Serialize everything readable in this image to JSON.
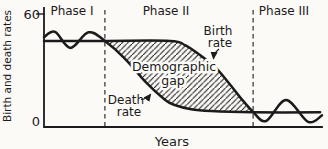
{
  "figure": {
    "background": "#fbfaf7",
    "ink": "#1b1b1b"
  },
  "chart_data": {
    "type": "line",
    "title": "",
    "xlabel": "Years",
    "ylabel": "Birth and death rates",
    "ylim": [
      0,
      60
    ],
    "xlim_percent_of_timespan": [
      0,
      100
    ],
    "grid": false,
    "legend": "none",
    "yticks": [
      {
        "value": 0,
        "label": "0"
      },
      {
        "value": 60,
        "label": "60"
      }
    ],
    "phases": [
      {
        "label": "Phase I",
        "x_start": 0,
        "x_end": 21.9
      },
      {
        "label": "Phase II",
        "x_start": 21.9,
        "x_end": 75.2
      },
      {
        "label": "Phase III",
        "x_start": 75.2,
        "x_end": 100
      }
    ],
    "series": [
      {
        "name": "Birth rate",
        "label_line1": "Birth",
        "label_line2": "rate",
        "points": [
          [
            0,
            45.7
          ],
          [
            21.9,
            45.7
          ],
          [
            45.3,
            45.7
          ],
          [
            50.7,
            43.5
          ],
          [
            56.1,
            38.2
          ],
          [
            61.5,
            31.9
          ],
          [
            66.2,
            23.9
          ],
          [
            70.5,
            15.9
          ],
          [
            75.2,
            8
          ],
          [
            79.9,
            3.2
          ],
          [
            87.1,
            14.3
          ],
          [
            95,
            2.7
          ],
          [
            100,
            6.2
          ]
        ]
      },
      {
        "name": "Death rate",
        "label_line1": "Death",
        "label_line2": "rate",
        "points": [
          [
            0,
            47.8
          ],
          [
            4,
            50.5
          ],
          [
            9.5,
            42
          ],
          [
            16,
            50.3
          ],
          [
            21.9,
            45.7
          ],
          [
            29,
            36.5
          ],
          [
            36.5,
            24
          ],
          [
            43.5,
            14.5
          ],
          [
            47,
            11.7
          ],
          [
            52.5,
            9.6
          ],
          [
            60,
            8.5
          ],
          [
            75.2,
            7.8
          ],
          [
            99.3,
            7.8
          ]
        ]
      }
    ],
    "gap": {
      "name": "Demographic gap",
      "label_line1": "Demographic",
      "label_line2": "gap",
      "x_start": 21.9,
      "x_end": 75.2,
      "fill_style": "diagonal-hatch"
    }
  }
}
